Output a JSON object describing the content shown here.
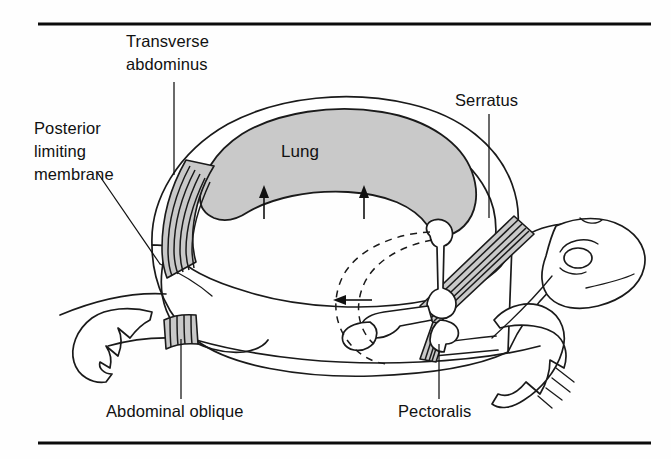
{
  "figure": {
    "kind": "anatomical-diagram",
    "background_color": "#fefefe",
    "ink_color": "#1a1a1a",
    "shade_color": "#c9c9c9"
  },
  "rules": {
    "top": {
      "name": "top-rule",
      "x1": 38,
      "y1": 24,
      "x2": 651,
      "y2": 24
    },
    "bottom": {
      "name": "bottom-rule",
      "x1": 38,
      "y1": 443,
      "x2": 651,
      "y2": 443
    }
  },
  "labels": {
    "transverse_abdominus": {
      "line1": "Transverse",
      "line2": "abdominus",
      "x": 126,
      "y": 47,
      "anchor": "start"
    },
    "posterior_limiting_membrane": {
      "line1": "Posterior",
      "line2": "limiting",
      "line3": "membrane",
      "x": 34,
      "y": 134,
      "anchor": "start"
    },
    "serratus": {
      "text": "Serratus",
      "x": 455,
      "y": 106,
      "anchor": "start"
    },
    "lung": {
      "text": "Lung",
      "x": 300,
      "y": 157,
      "anchor": "middle"
    },
    "abdominal_oblique": {
      "text": "Abdominal oblique",
      "x": 106,
      "y": 417,
      "anchor": "start"
    },
    "pectoralis": {
      "text": "Pectoralis",
      "x": 398,
      "y": 417,
      "anchor": "start"
    }
  },
  "muscle_groups": [
    {
      "name": "transverse-abdominus-muscle",
      "stripes": 7,
      "shaded": true
    },
    {
      "name": "serratus-muscle",
      "stripes": 6,
      "shaded": true
    },
    {
      "name": "abdominal-oblique-muscle",
      "stripes": 5,
      "shaded": true
    },
    {
      "name": "pectoralis-muscle",
      "stripes": 5,
      "shaded": true
    }
  ],
  "motion_indicators": {
    "lung_arrows": [
      {
        "name": "lung-arrow-left",
        "x": 264,
        "from_y": 219,
        "to_y": 190,
        "direction": "up"
      },
      {
        "name": "lung-arrow-right",
        "x": 364,
        "from_y": 219,
        "to_y": 190,
        "direction": "up"
      }
    ],
    "shoulder_arrow": {
      "name": "shoulder-arrow",
      "y": 300,
      "from_x": 372,
      "to_x": 334,
      "direction": "left"
    },
    "dashed_arcs": [
      {
        "name": "pectoral-girdle-arc-outer"
      },
      {
        "name": "pectoral-girdle-arc-inner"
      }
    ]
  },
  "leader_lines": [
    {
      "name": "leader-transverse-abdominus",
      "x1": 174,
      "y1": 82,
      "x2": 174,
      "y2": 175
    },
    {
      "name": "leader-posterior-limiting-membrane",
      "x1": 97,
      "y1": 172,
      "x2": 160,
      "y2": 264
    },
    {
      "name": "leader-serratus",
      "x1": 489,
      "y1": 114,
      "x2": 489,
      "y2": 218
    },
    {
      "name": "leader-abdominal-oblique",
      "x1": 181,
      "y1": 399,
      "x2": 181,
      "y2": 339
    },
    {
      "name": "leader-pectoralis",
      "x1": 439,
      "y1": 399,
      "x2": 439,
      "y2": 344
    }
  ]
}
